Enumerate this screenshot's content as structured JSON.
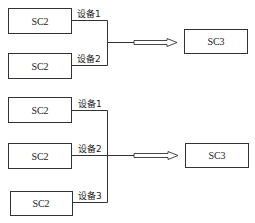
{
  "diagram": {
    "groups": [
      {
        "sources": [
          {
            "label": "SC2",
            "link_label": "设备1"
          },
          {
            "label": "SC2",
            "link_label": "设备2"
          }
        ],
        "target": {
          "label": "SC3"
        }
      },
      {
        "sources": [
          {
            "label": "SC2",
            "link_label": "设备1"
          },
          {
            "label": "SC2",
            "link_label": "设备2"
          },
          {
            "label": "SC2",
            "link_label": "设备3"
          }
        ],
        "target": {
          "label": "SC3"
        }
      }
    ]
  }
}
